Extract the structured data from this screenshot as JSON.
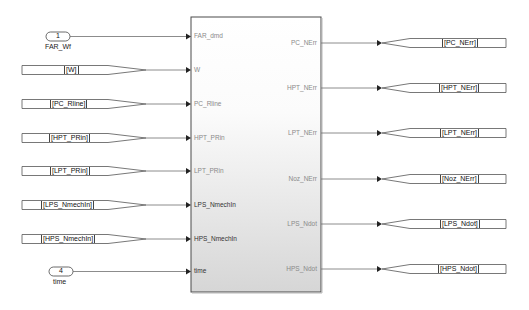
{
  "diagram": {
    "type": "simulink-subsystem",
    "colors": {
      "line": "#6e6e6e",
      "block_border": "#4a4a4a",
      "block_fill_top": "#ffffff",
      "block_fill_bottom": "#d9d9d9",
      "tag_border": "#555555",
      "port_label": "#8a8a8a"
    },
    "inports": [
      {
        "number": "1",
        "name": "FAR_Wf",
        "y": 36
      },
      {
        "number": "4",
        "name": "time",
        "y": 271
      }
    ],
    "from_tags": [
      {
        "label": "[W]",
        "y": 70
      },
      {
        "label": "[PC_Rline]",
        "y": 104
      },
      {
        "label": "[HPT_PRin]",
        "y": 138
      },
      {
        "label": "[LPT_PRin]",
        "y": 171
      },
      {
        "label": "[LPS_NmechIn]",
        "y": 205
      },
      {
        "label": "[HPS_NmechIn]",
        "y": 239
      }
    ],
    "subsystem": {
      "input_ports": [
        {
          "label": "FAR_dmd",
          "y": 36
        },
        {
          "label": "W",
          "y": 70
        },
        {
          "label": "PC_Rline",
          "y": 104
        },
        {
          "label": "HPT_PRin",
          "y": 138
        },
        {
          "label": "LPT_PRin",
          "y": 171
        },
        {
          "label": "LPS_NmechIn",
          "y": 205
        },
        {
          "label": "HPS_NmechIn",
          "y": 239
        },
        {
          "label": "time",
          "y": 271
        }
      ],
      "output_ports": [
        {
          "label": "PC_NErr",
          "y": 43
        },
        {
          "label": "HPT_NErr",
          "y": 88
        },
        {
          "label": "LPT_NErr",
          "y": 133
        },
        {
          "label": "Noz_NErr",
          "y": 179
        },
        {
          "label": "LPS_Ndot",
          "y": 224
        },
        {
          "label": "HPS_Ndot",
          "y": 269
        }
      ]
    },
    "goto_tags": [
      {
        "label": "[PC_NErr]",
        "y": 43
      },
      {
        "label": "[HPT_NErr]",
        "y": 88
      },
      {
        "label": "[LPT_NErr]",
        "y": 133
      },
      {
        "label": "[Noz_NErr]",
        "y": 179
      },
      {
        "label": "[LPS_Ndot]",
        "y": 224
      },
      {
        "label": "[HPS_Ndot]",
        "y": 269
      }
    ]
  }
}
